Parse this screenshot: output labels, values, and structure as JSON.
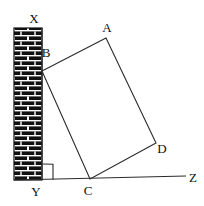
{
  "figure": {
    "background_color": "#ffffff",
    "line_color": "#2b2b2b",
    "wall_brick_color": "#111111",
    "wall_mortar_color": "#ffffff",
    "ground_label_right": "Z",
    "labels": {
      "A": "A",
      "B": "B",
      "C": "C",
      "D": "D",
      "X": "X",
      "Y": "Y",
      "Z": "Z"
    },
    "geometry": {
      "wall": {
        "x": 14,
        "y": 28,
        "width": 28,
        "height": 152
      },
      "rectangle_points": "106,38 42,71 90,179 156,143",
      "ground_line": {
        "x1": 14,
        "y1": 180,
        "x2": 186,
        "y2": 176
      },
      "wall_line": {
        "x1": 42,
        "y1": 28,
        "x2": 42,
        "y2": 180
      },
      "right_angle_mark": "43,164 53,164 53,179"
    },
    "label_positions": {
      "X": {
        "x": 34,
        "y": 23
      },
      "B": {
        "x": 44,
        "y": 56
      },
      "A": {
        "x": 103,
        "y": 32
      },
      "D": {
        "x": 158,
        "y": 153
      },
      "C": {
        "x": 84,
        "y": 194
      },
      "Y": {
        "x": 32,
        "y": 196
      },
      "Z": {
        "x": 188,
        "y": 182
      }
    }
  }
}
